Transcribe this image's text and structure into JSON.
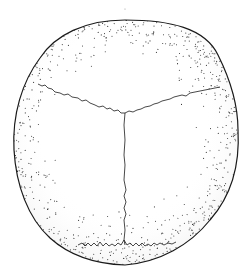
{
  "figure": {
    "background_color": "#ffffff",
    "line_color": "#1a1a1a",
    "stipple_color": "#3a3a3a",
    "labels": []
  }
}
